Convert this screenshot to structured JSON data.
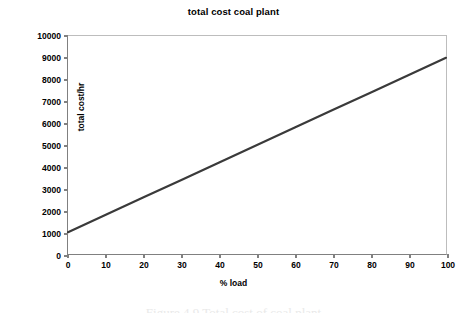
{
  "chart_data": {
    "type": "line",
    "title": "total cost coal plant",
    "xlabel": "% load",
    "ylabel": "total cost/hr",
    "xlim": [
      0,
      100
    ],
    "ylim": [
      0,
      10000
    ],
    "xticks": [
      0,
      10,
      20,
      30,
      40,
      50,
      60,
      70,
      80,
      90,
      100
    ],
    "yticks": [
      0,
      1000,
      2000,
      3000,
      4000,
      5000,
      6000,
      7000,
      8000,
      9000,
      10000
    ],
    "xtick_labels": [
      "0",
      "10",
      "20",
      "30",
      "40",
      "50",
      "60",
      "70",
      "80",
      "90",
      "100"
    ],
    "ytick_labels": [
      "0",
      "1000",
      "2000",
      "3000",
      "4000",
      "5000",
      "6000",
      "7000",
      "8000",
      "9000",
      "10000"
    ],
    "grid": false,
    "legend": false,
    "series": [
      {
        "name": "total cost",
        "color": "#3a3a3a",
        "line_width": 2,
        "x": [
          0,
          10,
          20,
          30,
          40,
          50,
          60,
          70,
          80,
          90,
          100
        ],
        "values": [
          1000,
          1800,
          2600,
          3400,
          4200,
          5000,
          5800,
          6600,
          7400,
          8200,
          9000
        ]
      }
    ],
    "annotations": []
  },
  "figure": {
    "caption_remnant": "Figure 4.9   Total cost of coal plant"
  }
}
